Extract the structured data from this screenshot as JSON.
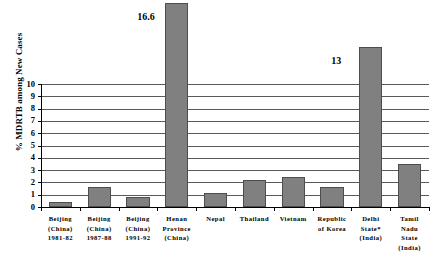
{
  "chart_data": {
    "type": "bar",
    "title": "",
    "xlabel": "",
    "ylabel": "% MDRTB among New Cases",
    "ylim": [
      0,
      10
    ],
    "grid": true,
    "legend": "none",
    "yticks": [
      "0",
      "1",
      "2",
      "3",
      "4",
      "5",
      "6",
      "7",
      "8",
      "9",
      "10"
    ],
    "categories": [
      "Beijing (China) 1981-82",
      "Beijing (China) 1987-88",
      "Beijing (China) 1991-92",
      "Henan Province (China)",
      "Nepal",
      "Thailand",
      "Vietnam",
      "Republic of Korea",
      "Delhi State* (India)",
      "Tamil Nadu State (India)"
    ],
    "category_lines": [
      [
        "Beijing",
        "(China)",
        "1981-82"
      ],
      [
        "Beijing",
        "(China)",
        "1987-88"
      ],
      [
        "Beijing",
        "(China)",
        "1991-92"
      ],
      [
        "Henan",
        "Province",
        "(China)"
      ],
      [
        "Nepal"
      ],
      [
        "Thailand"
      ],
      [
        "Vietnam"
      ],
      [
        "Republic",
        "of Korea"
      ],
      [
        "Delhi",
        "State*",
        "(India)"
      ],
      [
        "Tamil",
        "Nadu",
        "State",
        "(India)"
      ]
    ],
    "values": [
      0.4,
      1.6,
      0.8,
      16.6,
      1.1,
      2.2,
      2.4,
      1.65,
      13,
      3.5
    ],
    "value_labels": [
      {
        "index": 3,
        "text": "16.6"
      },
      {
        "index": 8,
        "text": "13"
      }
    ],
    "bar_color": "#808080",
    "bar_edge_color": "#4d4d4d",
    "gridline_color": "#58595b",
    "axis_color": "#000000",
    "background_color": "#ffffff"
  }
}
